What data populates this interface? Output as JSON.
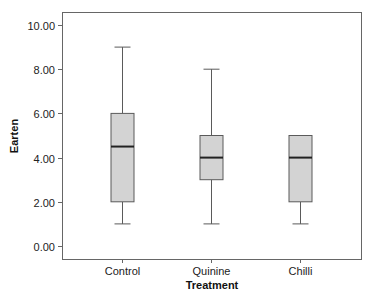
{
  "chart_data": {
    "type": "boxplot",
    "title": "",
    "xlabel": "Treatment",
    "ylabel": "Earten",
    "ylim": [
      0,
      10
    ],
    "yticks": [
      0,
      2,
      4,
      6,
      8,
      10
    ],
    "ytick_labels": [
      "0.00",
      "2.00",
      "4.00",
      "6.00",
      "8.00",
      "10.00"
    ],
    "categories": [
      "Control",
      "Quinine",
      "Chilli"
    ],
    "series": [
      {
        "name": "Control",
        "min": 1.0,
        "q1": 2.0,
        "median": 4.5,
        "q3": 6.0,
        "max": 9.0
      },
      {
        "name": "Quinine",
        "min": 1.0,
        "q1": 3.0,
        "median": 4.0,
        "q3": 5.0,
        "max": 8.0
      },
      {
        "name": "Chilli",
        "min": 1.0,
        "q1": 2.0,
        "median": 4.0,
        "q3": 5.0,
        "max": 5.0
      }
    ],
    "grid": false,
    "legend": null,
    "colors": {
      "box_fill": "#d3d3d3",
      "box_edge": "#5a5a5a",
      "median": "#222222",
      "whisker": "#5a5a5a",
      "axis": "#666666"
    }
  }
}
